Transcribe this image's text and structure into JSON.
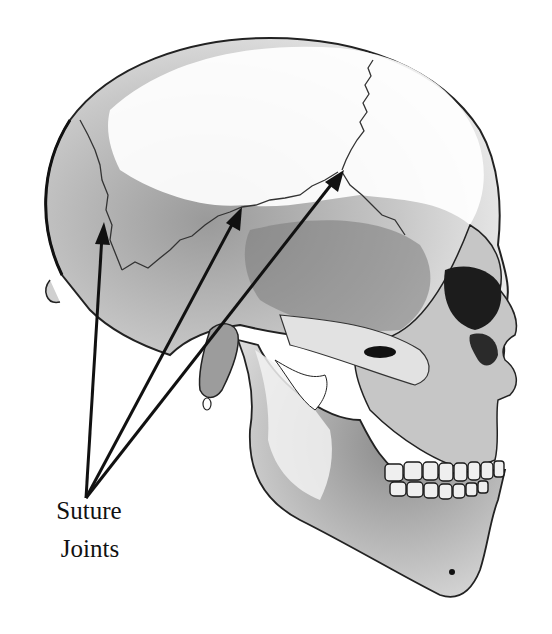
{
  "figure": {
    "label": {
      "line1": "Suture",
      "line2": "Joints"
    },
    "arrows": [
      {
        "name": "lambdoid-suture-arrow",
        "from": [
          86,
          498
        ],
        "to": [
          104,
          222
        ]
      },
      {
        "name": "squamous-suture-arrow",
        "from": [
          86,
          498
        ],
        "to": [
          242,
          207
        ]
      },
      {
        "name": "coronal-suture-arrow",
        "from": [
          86,
          498
        ],
        "to": [
          344,
          170
        ]
      }
    ],
    "colors": {
      "ink": "#111111",
      "bone_light": "#f4f4f4",
      "bone_mid": "#bdbdbd",
      "bone_dark": "#6e6e6e",
      "background": "#ffffff"
    }
  }
}
